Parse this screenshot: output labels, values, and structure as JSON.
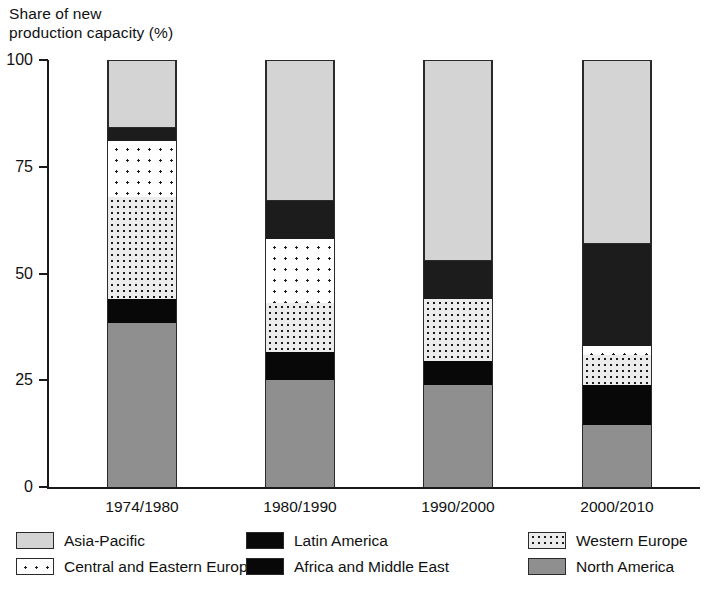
{
  "chart_data": {
    "type": "bar",
    "variant": "stacked-100",
    "title": "Share of new\nproduction capacity (%)",
    "xlabel": "",
    "ylabel": "Share of new production capacity (%)",
    "ylim": [
      0,
      100
    ],
    "yticks": [
      0,
      25,
      50,
      75,
      100
    ],
    "ytick_labels": [
      "0",
      "25",
      "50",
      "75",
      "100"
    ],
    "grid": false,
    "legend_position": "bottom",
    "categories": [
      "1974/1980",
      "1980/1990",
      "1990/2000",
      "2000/2010"
    ],
    "stack_order_bottom_to_top": [
      "North America",
      "Latin America",
      "Western Europe",
      "Central and Eastern Europe",
      "Africa and Middle East",
      "Asia-Pacific"
    ],
    "series": [
      {
        "name": "North America",
        "pattern": "solid-gray",
        "color": "#8f8f8f",
        "values": [
          38.5,
          25.0,
          24.0,
          14.5
        ]
      },
      {
        "name": "Latin America",
        "pattern": "solid-black",
        "color": "#080808",
        "values": [
          5.5,
          6.5,
          5.5,
          9.5
        ]
      },
      {
        "name": "Western Europe",
        "pattern": "dense-dots",
        "color": "#ececec",
        "values": [
          24.0,
          11.5,
          14.5,
          7.0
        ]
      },
      {
        "name": "Central and Eastern Europe",
        "pattern": "sparse-dots",
        "color": "#ffffff",
        "values": [
          13.0,
          15.0,
          0.0,
          2.0
        ]
      },
      {
        "name": "Africa and Middle East",
        "pattern": "solid-black",
        "color": "#1c1c1c",
        "values": [
          3.0,
          9.0,
          9.0,
          24.0
        ]
      },
      {
        "name": "Asia-Pacific",
        "pattern": "light-gray",
        "color": "#d4d4d4",
        "values": [
          16.0,
          33.0,
          47.0,
          43.0
        ]
      }
    ]
  },
  "legend": {
    "items": [
      {
        "label": "Asia-Pacific",
        "swatch": "light-gray"
      },
      {
        "label": "Central and Eastern Europe",
        "swatch": "sparse-dots"
      },
      {
        "label": "Latin America",
        "swatch": "solid-black"
      },
      {
        "label": "Africa and Middle East",
        "swatch": "solid-black"
      },
      {
        "label": "Western Europe",
        "swatch": "dense-dots"
      },
      {
        "label": "North America",
        "swatch": "solid-gray"
      }
    ]
  }
}
